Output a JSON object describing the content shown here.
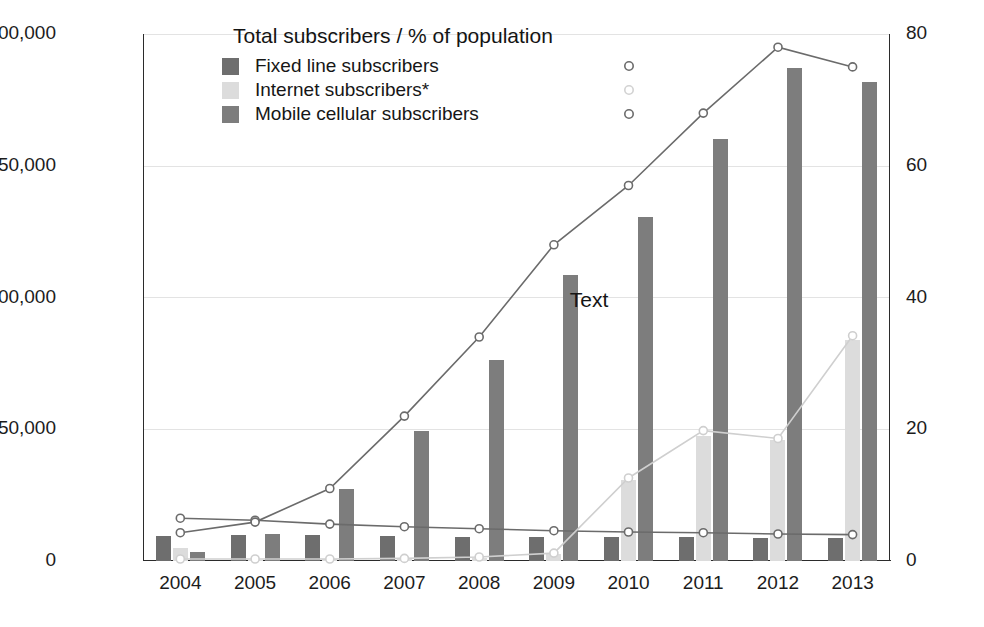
{
  "chart_data": {
    "type": "bar",
    "title": "Total subscribers / % of population",
    "xlabel": "",
    "ylabel": "",
    "ylim": [
      0,
      600000
    ],
    "y2lim": [
      0,
      80
    ],
    "grid": true,
    "legend_position": "top-left",
    "categories": [
      "2004",
      "2005",
      "2006",
      "2007",
      "2008",
      "2009",
      "2010",
      "2011",
      "2012",
      "2013"
    ],
    "y_ticks_left": [
      "0",
      "150,000",
      "300,000",
      "450,000",
      "600,000"
    ],
    "y_ticks_right": [
      "0",
      "20",
      "40",
      "60",
      "80"
    ],
    "bar_series": [
      {
        "name": "Fixed line subscribers",
        "color": "#6e6e6e",
        "axis": "left",
        "values": [
          29000,
          29500,
          29500,
          29000,
          27500,
          27000,
          27000,
          27000,
          26500,
          26000
        ]
      },
      {
        "name": "Internet subscribers*",
        "color": "#dcdcdc",
        "axis": "left",
        "values": [
          15000,
          1500,
          2000,
          2500,
          3500,
          8000,
          92000,
          142000,
          138000,
          252000
        ]
      },
      {
        "name": "Mobile cellular subscribers",
        "color": "#7d7d7d",
        "axis": "left",
        "values": [
          10000,
          31000,
          82000,
          148000,
          229000,
          326000,
          392000,
          480000,
          561000,
          545000
        ]
      }
    ],
    "line_series": [
      {
        "name": "Fixed line subscribers",
        "color": "#6b6b6b",
        "axis": "right",
        "marker": "circle",
        "values": [
          6.5,
          6.2,
          5.6,
          5.2,
          4.9,
          4.6,
          4.4,
          4.3,
          4.1,
          4.0
        ]
      },
      {
        "name": "Internet subscribers*",
        "color": "#cfcfcf",
        "axis": "right",
        "marker": "circle",
        "values": [
          0.3,
          0.3,
          0.3,
          0.4,
          0.6,
          1.2,
          12.6,
          19.8,
          18.6,
          34.2
        ]
      },
      {
        "name": "Mobile cellular subscribers",
        "color": "#6b6b6b",
        "axis": "right",
        "marker": "circle",
        "values": [
          4.3,
          5.9,
          11.0,
          22.0,
          34.0,
          48.0,
          57.0,
          68.0,
          78.0,
          75.0
        ]
      }
    ],
    "annotations": [
      {
        "text": "Text",
        "x_category": "2009",
        "y_value": 295000
      }
    ]
  },
  "legend": {
    "title": "Total subscribers / % of population",
    "items": [
      {
        "label": "Fixed line subscribers",
        "swatch": "fixed",
        "marker_color": "#6b6b6b"
      },
      {
        "label": "Internet subscribers*",
        "swatch": "internet",
        "marker_color": "#d2d2d2"
      },
      {
        "label": "Mobile cellular subscribers",
        "swatch": "mobile",
        "marker_color": "#6b6b6b"
      }
    ]
  },
  "colors": {
    "fixed": "#6e6e6e",
    "internet": "#dcdcdc",
    "mobile": "#7d7d7d",
    "grid": "#e3e3e3",
    "axis": "#2b2b2b"
  }
}
